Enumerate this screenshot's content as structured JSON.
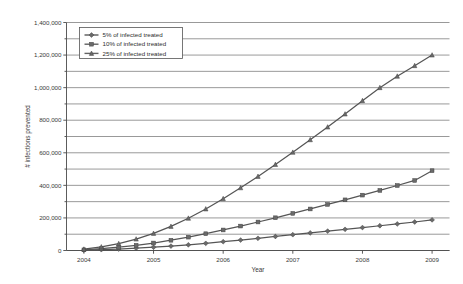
{
  "chart_data": {
    "type": "line",
    "title": "",
    "xlabel": "Year",
    "ylabel": "# infections prevented",
    "xlim": [
      2003.75,
      2009.25
    ],
    "ylim": [
      0,
      1400000
    ],
    "grid": true,
    "legend_position": "top-left",
    "x_tick_labels": [
      "2004",
      "2005",
      "2006",
      "2007",
      "2008",
      "2009"
    ],
    "x_ticks": [
      2004,
      2005,
      2006,
      2007,
      2008,
      2009
    ],
    "y_tick_labels": [
      "0",
      "200,000",
      "400,000",
      "600,000",
      "800,000",
      "1,000,000",
      "1,200,000",
      "1,400,000"
    ],
    "y_ticks": [
      0,
      200000,
      400000,
      600000,
      800000,
      1000000,
      1200000,
      1400000
    ],
    "y_minor_step": 100000,
    "x": [
      2004,
      2004.25,
      2004.5,
      2004.75,
      2005,
      2005.25,
      2005.5,
      2005.75,
      2006,
      2006.25,
      2006.5,
      2006.75,
      2007,
      2007.25,
      2007.5,
      2007.75,
      2008,
      2008.25,
      2008.5,
      2008.75,
      2009
    ],
    "series": [
      {
        "name": "5% of infected treated",
        "marker": "diamond",
        "color": "#5a5a5a",
        "values": [
          2000,
          5000,
          9000,
          14000,
          20000,
          27000,
          35000,
          44000,
          54000,
          64000,
          75000,
          86000,
          97000,
          108000,
          119000,
          130000,
          141000,
          152000,
          163000,
          175000,
          188000
        ]
      },
      {
        "name": "10% of infected treated",
        "marker": "square",
        "color": "#606060",
        "values": [
          4000,
          11000,
          20000,
          32000,
          46000,
          63000,
          82000,
          103000,
          126000,
          150000,
          175000,
          201000,
          228000,
          255000,
          283000,
          311000,
          340000,
          369000,
          399000,
          430000,
          490000
        ]
      },
      {
        "name": "25% of infected treated",
        "marker": "triangle",
        "color": "#646464",
        "values": [
          8000,
          22000,
          42000,
          70000,
          105000,
          148000,
          198000,
          255000,
          318000,
          385000,
          455000,
          528000,
          603000,
          680000,
          758000,
          838000,
          920000,
          1000000,
          1070000,
          1135000,
          1200000
        ]
      }
    ]
  },
  "legend": {
    "entries": [
      {
        "label": "5% of infected treated"
      },
      {
        "label": "10% of infected treated"
      },
      {
        "label": "25% of infected treated"
      }
    ]
  },
  "axes": {
    "x_title": "Year",
    "y_title": "# infections prevented"
  }
}
